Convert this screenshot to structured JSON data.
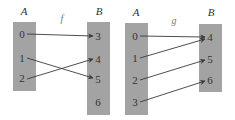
{
  "colors": {
    "background": "#ffffff",
    "set_box": "#a3a3a3",
    "arrow": "#3a3a3a",
    "text": "#333333"
  },
  "diagrams": [
    {
      "function_label": "f",
      "domain": {
        "label": "A",
        "elements": [
          "0",
          "1",
          "2"
        ]
      },
      "codomain": {
        "label": "B",
        "elements": [
          "3",
          "4",
          "5",
          "6"
        ]
      },
      "mappings": [
        {
          "from": "0",
          "to": "3"
        },
        {
          "from": "1",
          "to": "5"
        },
        {
          "from": "2",
          "to": "4"
        }
      ]
    },
    {
      "function_label": "g",
      "domain": {
        "label": "A",
        "elements": [
          "0",
          "1",
          "2",
          "3"
        ]
      },
      "codomain": {
        "label": "B",
        "elements": [
          "4",
          "5",
          "6"
        ]
      },
      "mappings": [
        {
          "from": "0",
          "to": "4"
        },
        {
          "from": "1",
          "to": "4"
        },
        {
          "from": "2",
          "to": "5"
        },
        {
          "from": "3",
          "to": "6"
        }
      ]
    }
  ]
}
